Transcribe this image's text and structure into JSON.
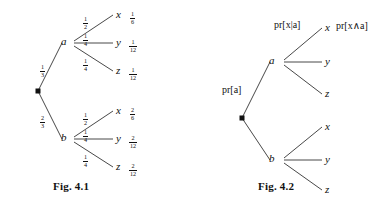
{
  "document": {
    "type": "probability-tree-diagrams",
    "background_color": "#ffffff",
    "ink_color": "#111111"
  },
  "figures": [
    {
      "id": "fig-4-1",
      "caption": "Fig. 4.1",
      "description": "Probability tree with numeric edge weights and leaf probabilities",
      "root_label": "",
      "branches": [
        {
          "node": "a",
          "edge_label_num": "1",
          "edge_label_den": "3",
          "leaves": [
            {
              "name": "x",
              "edge_num": "1",
              "edge_den": "2",
              "value_num": "1",
              "value_den": "6"
            },
            {
              "name": "y",
              "edge_num": "1",
              "edge_den": "4",
              "value_num": "1",
              "value_den": "12"
            },
            {
              "name": "z",
              "edge_num": "1",
              "edge_den": "4",
              "value_num": "1",
              "value_den": "12"
            }
          ]
        },
        {
          "node": "b",
          "edge_label_num": "2",
          "edge_label_den": "3",
          "leaves": [
            {
              "name": "x",
              "edge_num": "1",
              "edge_den": "2",
              "value_num": "2",
              "value_den": "6"
            },
            {
              "name": "y",
              "edge_num": "1",
              "edge_den": "4",
              "value_num": "2",
              "value_den": "12"
            },
            {
              "name": "z",
              "edge_num": "1",
              "edge_den": "4",
              "value_num": "2",
              "value_den": "12"
            }
          ]
        }
      ]
    },
    {
      "id": "fig-4-2",
      "caption": "Fig. 4.2",
      "description": "Probability tree with symbolic probability expressions",
      "root_label": "",
      "branches": [
        {
          "node": "a",
          "edge_label": "pr[a]",
          "leaves": [
            {
              "name": "x",
              "edge_label": "pr[x|a]",
              "value_label": "pr[x∧a]"
            },
            {
              "name": "y",
              "edge_label": "",
              "value_label": ""
            },
            {
              "name": "z",
              "edge_label": "",
              "value_label": ""
            }
          ]
        },
        {
          "node": "b",
          "edge_label": "",
          "leaves": [
            {
              "name": "x",
              "edge_label": "",
              "value_label": ""
            },
            {
              "name": "y",
              "edge_label": "",
              "value_label": ""
            },
            {
              "name": "z",
              "edge_label": "",
              "value_label": ""
            }
          ]
        }
      ]
    }
  ],
  "labels": {
    "fig1": {
      "node_a": "a",
      "node_b": "b",
      "a_edge_num": "1",
      "a_edge_den": "3",
      "b_edge_num": "2",
      "b_edge_den": "3",
      "a_x_num": "1",
      "a_x_den": "2",
      "a_y_num": "1",
      "a_y_den": "4",
      "a_z_num": "1",
      "a_z_den": "4",
      "b_x_num": "1",
      "b_x_den": "2",
      "b_y_num": "1",
      "b_y_den": "4",
      "b_z_num": "1",
      "b_z_den": "4",
      "leaf_ax": "x",
      "leaf_ay": "y",
      "leaf_az": "z",
      "leaf_bx": "x",
      "leaf_by": "y",
      "leaf_bz": "z",
      "val_ax_num": "1",
      "val_ax_den": "6",
      "val_ay_num": "1",
      "val_ay_den": "12",
      "val_az_num": "1",
      "val_az_den": "12",
      "val_bx_num": "2",
      "val_bx_den": "6",
      "val_by_num": "2",
      "val_by_den": "12",
      "val_bz_num": "2",
      "val_bz_den": "12",
      "caption": "Fig. 4.1"
    },
    "fig2": {
      "node_a": "a",
      "node_b": "b",
      "pr_a": "pr[a]",
      "pr_x_given_a": "pr[x|a]",
      "pr_x_and_a": "pr[x∧a]",
      "leaf_ax": "x",
      "leaf_ay": "y",
      "leaf_az": "z",
      "leaf_bx": "x",
      "leaf_by": "y",
      "leaf_bz": "z",
      "caption": "Fig. 4.2"
    }
  }
}
